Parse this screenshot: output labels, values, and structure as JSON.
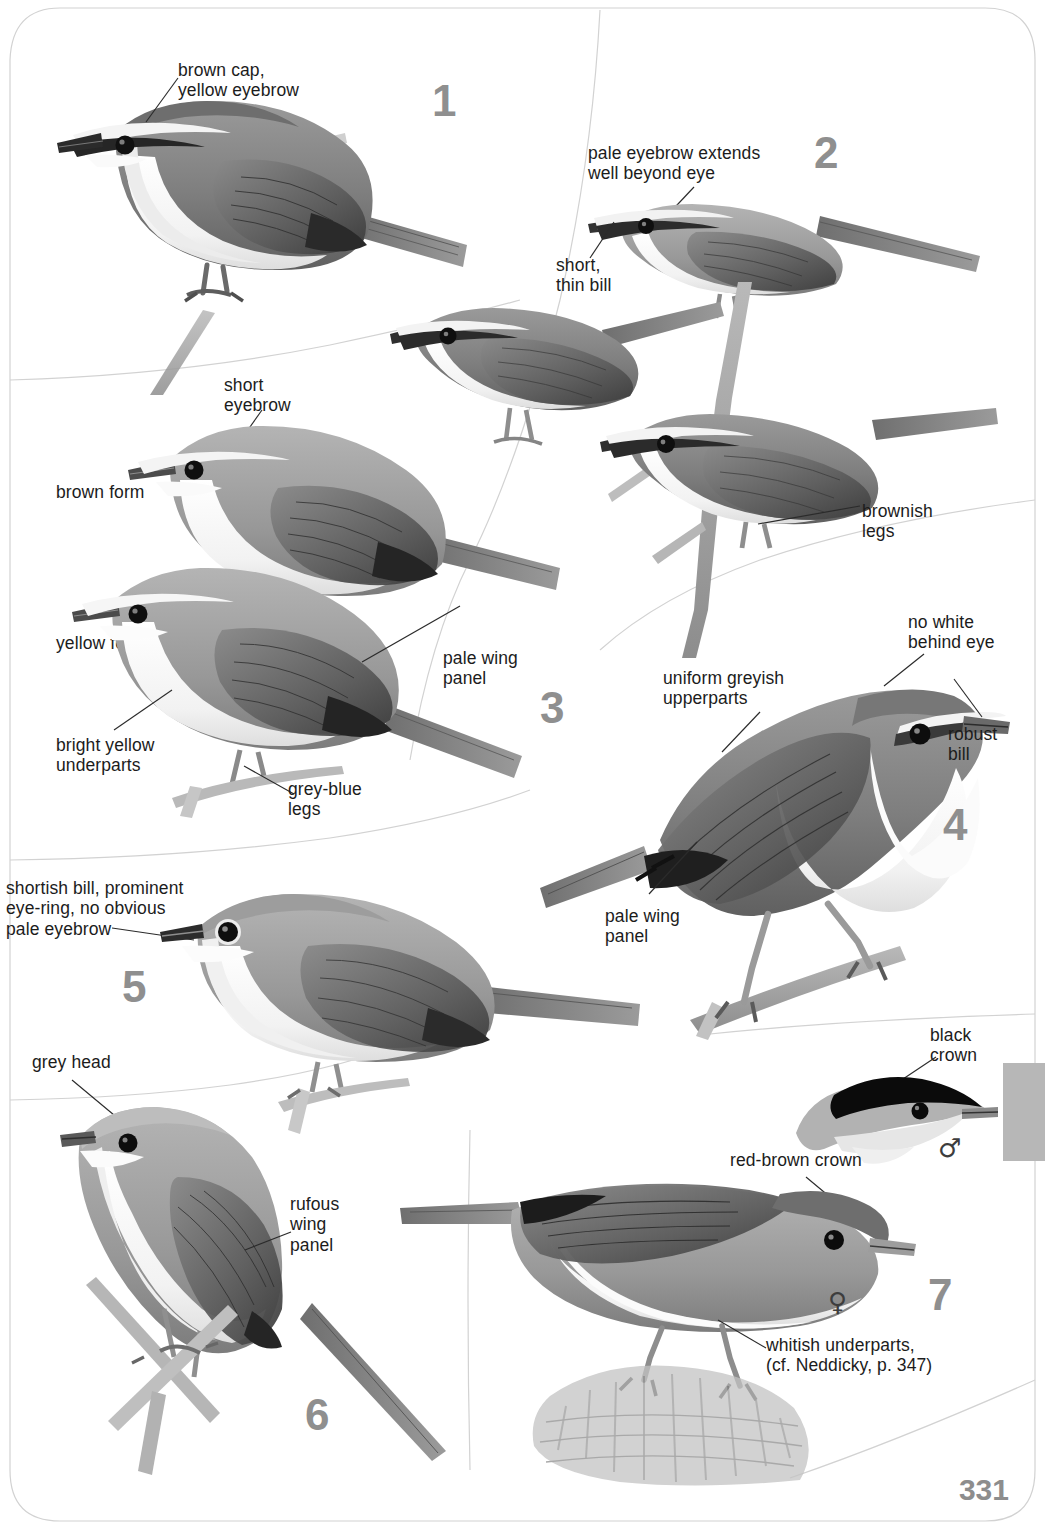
{
  "page": {
    "number": "331",
    "kind": "field-guide-plate",
    "background_color": "#ffffff",
    "number_color": "#8f8f8f",
    "edge_tab_color": "#b7b7b7"
  },
  "species": [
    {
      "number": "1",
      "labels": [
        {
          "id": "brown-cap-yellow-eyebrow",
          "text": "brown cap,\nyellow eyebrow"
        }
      ]
    },
    {
      "number": "2",
      "labels": [
        {
          "id": "pale-eyebrow-extends",
          "text": "pale eyebrow extends\nwell beyond eye"
        },
        {
          "id": "short-thin-bill",
          "text": "short,\nthin bill"
        },
        {
          "id": "brownish-legs",
          "text": "brownish\nlegs"
        }
      ]
    },
    {
      "number": "3",
      "labels": [
        {
          "id": "short-eyebrow",
          "text": "short\neyebrow"
        },
        {
          "id": "brown-form",
          "text": "brown form"
        },
        {
          "id": "yellow-form",
          "text": "yellow form"
        },
        {
          "id": "pale-wing-panel-3",
          "text": "pale wing\npanel"
        },
        {
          "id": "bright-yellow-underparts",
          "text": "bright yellow\nunderparts"
        },
        {
          "id": "grey-blue-legs",
          "text": "grey-blue\nlegs"
        }
      ]
    },
    {
      "number": "4",
      "labels": [
        {
          "id": "uniform-greyish-upperparts",
          "text": "uniform greyish\nupperparts"
        },
        {
          "id": "no-white-behind-eye",
          "text": "no white\nbehind eye"
        },
        {
          "id": "robust-bill",
          "text": "robust\nbill"
        },
        {
          "id": "pale-wing-panel-4",
          "text": "pale wing\npanel"
        }
      ]
    },
    {
      "number": "5",
      "labels": [
        {
          "id": "shortish-bill-eye-ring",
          "text": "shortish bill, prominent\neye-ring, no obvious\npale eyebrow"
        }
      ]
    },
    {
      "number": "6",
      "labels": [
        {
          "id": "grey-head",
          "text": "grey head"
        },
        {
          "id": "rufous-wing-panel",
          "text": "rufous\nwing\npanel"
        }
      ]
    },
    {
      "number": "7",
      "labels": [
        {
          "id": "black-crown",
          "text": "black\ncrown"
        },
        {
          "id": "red-brown-crown",
          "text": "red-brown crown"
        },
        {
          "id": "whitish-underparts",
          "text": "whitish underparts,\n(cf. Neddicky, p. 347)"
        }
      ],
      "sex_symbols": [
        {
          "id": "male-symbol",
          "glyph": "♂"
        },
        {
          "id": "female-symbol",
          "glyph": "♀"
        }
      ]
    }
  ],
  "labels_flat": {
    "brown_cap_yellow_eyebrow": "brown cap,\nyellow eyebrow",
    "pale_eyebrow_extends": "pale eyebrow extends\nwell beyond eye",
    "short_thin_bill": "short,\nthin bill",
    "brownish_legs": "brownish\nlegs",
    "short_eyebrow": "short\neyebrow",
    "brown_form": "brown form",
    "yellow_form": "yellow form",
    "pale_wing_panel_3": "pale wing\npanel",
    "bright_yellow_underparts": "bright yellow\nunderparts",
    "grey_blue_legs": "grey-blue\nlegs",
    "uniform_greyish_upperparts": "uniform greyish\nupperparts",
    "no_white_behind_eye": "no white\nbehind eye",
    "robust_bill": "robust\nbill",
    "pale_wing_panel_4": "pale wing\npanel",
    "shortish_bill_eye_ring": "shortish bill, prominent\neye-ring, no obvious\npale eyebrow",
    "grey_head": "grey head",
    "rufous_wing_panel": "rufous\nwing\npanel",
    "black_crown": "black\ncrown",
    "red_brown_crown": "red-brown crown",
    "whitish_underparts": "whitish underparts,\n(cf. Neddicky, p. 347)"
  },
  "numbers": {
    "n1": "1",
    "n2": "2",
    "n3": "3",
    "n4": "4",
    "n5": "5",
    "n6": "6",
    "n7": "7"
  },
  "symbols": {
    "male": "♂",
    "female": "♀"
  }
}
